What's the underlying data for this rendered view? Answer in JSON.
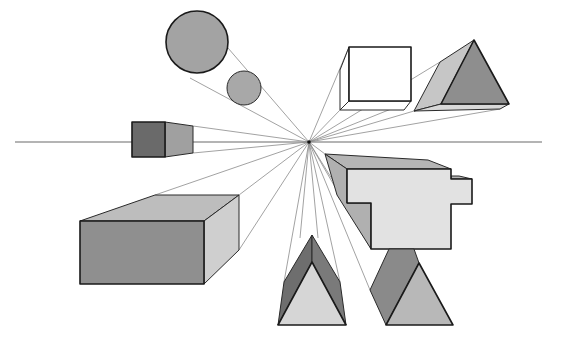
{
  "diagram": {
    "title": "",
    "type": "one-point perspective",
    "vanishing_point": {
      "x": 309,
      "y": 142
    },
    "horizon_line": {
      "x1": 15,
      "x2": 542,
      "y": 142
    },
    "colors": {
      "background": "#ffffff",
      "outline": "#1a1a1a",
      "guide_line": "#8a8a8a",
      "dark_gray": "#6e6e6e",
      "mid_gray": "#9a9a9a",
      "light_gray": "#bdbdbd",
      "pale_gray": "#e2e2e2",
      "white": "#ffffff"
    },
    "shapes": [
      {
        "name": "large-sphere",
        "label": ""
      },
      {
        "name": "small-sphere",
        "label": ""
      },
      {
        "name": "wireframe-cube",
        "label": ""
      },
      {
        "name": "upper-triangular-prism",
        "label": ""
      },
      {
        "name": "small-box",
        "label": ""
      },
      {
        "name": "stepped-block",
        "label": ""
      },
      {
        "name": "large-box",
        "label": ""
      },
      {
        "name": "lower-center-prism",
        "label": ""
      },
      {
        "name": "lower-right-prism",
        "label": ""
      }
    ]
  }
}
